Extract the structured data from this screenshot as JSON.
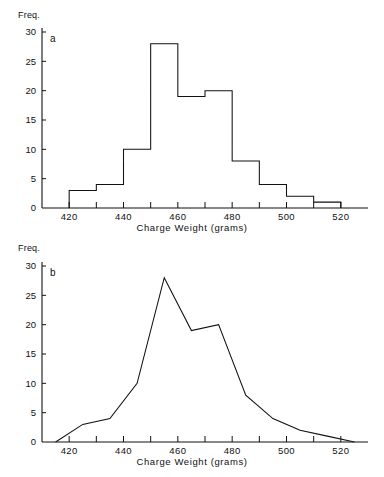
{
  "figure": {
    "background": "#ffffff",
    "ink_color": "#111111"
  },
  "panels": [
    {
      "tag": "a",
      "y_axis_label": "Freq.",
      "x_axis_label": "Charge Weight (grams)",
      "y_ticks": [
        "0",
        "5",
        "10",
        "15",
        "20",
        "25",
        "30"
      ],
      "x_ticks": [
        "420",
        "440",
        "460",
        "480",
        "500",
        "520"
      ]
    },
    {
      "tag": "b",
      "y_axis_label": "Freq.",
      "x_axis_label": "Charge Weight (grams)",
      "y_ticks": [
        "0",
        "5",
        "10",
        "15",
        "20",
        "25",
        "30"
      ],
      "x_ticks": [
        "420",
        "440",
        "460",
        "480",
        "500",
        "520"
      ]
    }
  ],
  "chart_data": [
    {
      "type": "bar",
      "title": "",
      "subtitle": "a",
      "xlabel": "Charge Weight (grams)",
      "ylabel": "Freq.",
      "xlim": [
        410,
        530
      ],
      "ylim": [
        0,
        30
      ],
      "xtick_values": [
        420,
        440,
        460,
        480,
        500,
        520
      ],
      "xtick_labels": [
        "420",
        "440",
        "460",
        "480",
        "500",
        "520"
      ],
      "xminor_tick_values": [
        410,
        430,
        450,
        470,
        490,
        510
      ],
      "ytick_values": [
        0,
        5,
        10,
        15,
        20,
        25,
        30
      ],
      "ytick_labels": [
        "0",
        "5",
        "10",
        "15",
        "20",
        "25",
        "30"
      ],
      "grid": false,
      "legend": "none",
      "bin_width": 10,
      "bins": [
        {
          "left": 420,
          "right": 430,
          "midpoint": 425,
          "value": 3
        },
        {
          "left": 430,
          "right": 440,
          "midpoint": 435,
          "value": 4
        },
        {
          "left": 440,
          "right": 450,
          "midpoint": 445,
          "value": 10
        },
        {
          "left": 450,
          "right": 460,
          "midpoint": 455,
          "value": 28
        },
        {
          "left": 460,
          "right": 470,
          "midpoint": 465,
          "value": 19
        },
        {
          "left": 470,
          "right": 480,
          "midpoint": 475,
          "value": 20
        },
        {
          "left": 480,
          "right": 490,
          "midpoint": 485,
          "value": 8
        },
        {
          "left": 490,
          "right": 500,
          "midpoint": 495,
          "value": 4
        },
        {
          "left": 500,
          "right": 510,
          "midpoint": 505,
          "value": 2
        },
        {
          "left": 510,
          "right": 520,
          "midpoint": 515,
          "value": 1
        }
      ],
      "categories": [
        "420-430",
        "430-440",
        "440-450",
        "450-460",
        "460-470",
        "470-480",
        "480-490",
        "490-500",
        "500-510",
        "510-520"
      ],
      "values": [
        3,
        4,
        10,
        28,
        19,
        20,
        8,
        4,
        2,
        1
      ]
    },
    {
      "type": "line",
      "title": "",
      "subtitle": "b",
      "xlabel": "Charge Weight (grams)",
      "ylabel": "Freq.",
      "xlim": [
        410,
        530
      ],
      "ylim": [
        0,
        30
      ],
      "xtick_values": [
        420,
        440,
        460,
        480,
        500,
        520
      ],
      "xtick_labels": [
        "420",
        "440",
        "460",
        "480",
        "500",
        "520"
      ],
      "xminor_tick_values": [
        410,
        430,
        450,
        470,
        490,
        510
      ],
      "ytick_values": [
        0,
        5,
        10,
        15,
        20,
        25,
        30
      ],
      "ytick_labels": [
        "0",
        "5",
        "10",
        "15",
        "20",
        "25",
        "30"
      ],
      "grid": false,
      "legend": "none",
      "x": [
        415,
        425,
        435,
        445,
        455,
        465,
        475,
        485,
        495,
        505,
        515,
        525
      ],
      "values": [
        0,
        3,
        4,
        10,
        28,
        19,
        20,
        8,
        4,
        2,
        1,
        0
      ]
    }
  ]
}
